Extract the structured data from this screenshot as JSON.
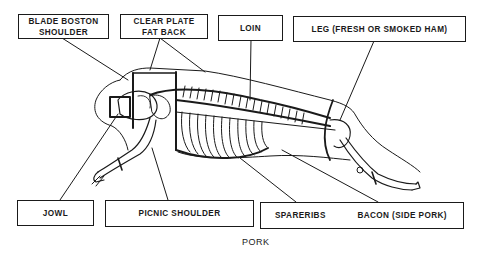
{
  "diagram": {
    "title": "PORK",
    "labels": {
      "blade_boston_shoulder": [
        "BLADE BOSTON",
        "SHOULDER"
      ],
      "clear_plate_fat_back": [
        "CLEAR PLATE",
        "FAT BACK"
      ],
      "loin": "LOIN",
      "leg": "LEG (FRESH OR SMOKED HAM)",
      "jowl": "JOWL",
      "picnic_shoulder": "PICNIC SHOULDER",
      "spareribs": "SPARERIBS",
      "bacon": "BACON (SIDE PORK)"
    },
    "colors": {
      "ink": "#1a1a1a",
      "background": "#ffffff"
    }
  }
}
